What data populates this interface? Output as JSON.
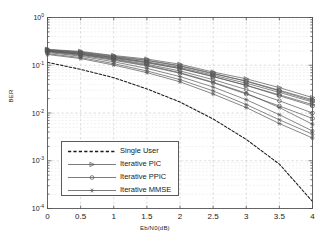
{
  "figure": {
    "background": "#ffffff",
    "axes_color": "#4d4d4d",
    "grid_color": "#c8c8c8",
    "curve_color": "#595959",
    "reference_color": "#1a1a1a"
  },
  "axis": {
    "xlabel": "Eb/N0(dB)",
    "ylabel": "BER",
    "xticks": [
      "0",
      "0.5",
      "1",
      "1.5",
      "2",
      "2.5",
      "3",
      "3.5",
      "4"
    ],
    "yticks": [
      "10",
      "10",
      "10",
      "10",
      "10"
    ],
    "yexps": [
      "0",
      "-1",
      "-2",
      "-3",
      "-4"
    ]
  },
  "legend": {
    "entries": [
      {
        "label": "Single User",
        "marker": "none",
        "style": "dashed"
      },
      {
        "label": "Iterative PIC",
        "marker": "triangle",
        "style": "solid"
      },
      {
        "label": "Iterative PPIC",
        "marker": "circle",
        "style": "solid"
      },
      {
        "label": "Iterative MMSE",
        "marker": "star",
        "style": "solid"
      }
    ]
  },
  "chart_data": {
    "type": "line",
    "title": "",
    "xlabel": "Eb/N0(dB)",
    "ylabel": "BER",
    "xlim": [
      0,
      4
    ],
    "ylim": [
      0.0001,
      1
    ],
    "yscale": "log",
    "grid": true,
    "legend_position": "lower-left-inside",
    "x": [
      0,
      0.5,
      1,
      1.5,
      2,
      2.5,
      3,
      3.5,
      4
    ],
    "series": [
      {
        "name": "Single User",
        "marker": "none",
        "style": "dashed",
        "values": [
          0.115,
          0.082,
          0.055,
          0.032,
          0.017,
          0.0075,
          0.0028,
          0.00085,
          0.00014
        ]
      },
      {
        "name": "Iterative PIC iter 1",
        "marker": "triangle",
        "style": "solid",
        "values": [
          0.215,
          0.195,
          0.16,
          0.135,
          0.105,
          0.072,
          0.052,
          0.034,
          0.021
        ]
      },
      {
        "name": "Iterative PIC iter 2",
        "marker": "triangle",
        "style": "solid",
        "values": [
          0.21,
          0.185,
          0.15,
          0.125,
          0.096,
          0.066,
          0.047,
          0.03,
          0.019
        ]
      },
      {
        "name": "Iterative PIC iter 3",
        "marker": "triangle",
        "style": "solid",
        "values": [
          0.205,
          0.178,
          0.145,
          0.118,
          0.09,
          0.062,
          0.042,
          0.027,
          0.017
        ]
      },
      {
        "name": "Iterative PIC iter 4",
        "marker": "triangle",
        "style": "solid",
        "values": [
          0.2,
          0.172,
          0.14,
          0.112,
          0.085,
          0.058,
          0.038,
          0.024,
          0.015
        ]
      },
      {
        "name": "Iterative PPIC iter 1",
        "marker": "circle",
        "style": "solid",
        "values": [
          0.212,
          0.19,
          0.155,
          0.128,
          0.098,
          0.068,
          0.046,
          0.029,
          0.018
        ]
      },
      {
        "name": "Iterative PPIC iter 2",
        "marker": "circle",
        "style": "solid",
        "values": [
          0.205,
          0.18,
          0.145,
          0.115,
          0.086,
          0.058,
          0.038,
          0.023,
          0.014
        ]
      },
      {
        "name": "Iterative PPIC iter 3",
        "marker": "circle",
        "style": "solid",
        "values": [
          0.198,
          0.17,
          0.135,
          0.105,
          0.076,
          0.05,
          0.031,
          0.018,
          0.01
        ]
      },
      {
        "name": "Iterative PPIC iter 4",
        "marker": "circle",
        "style": "solid",
        "values": [
          0.192,
          0.162,
          0.127,
          0.097,
          0.068,
          0.043,
          0.025,
          0.014,
          0.0077
        ]
      },
      {
        "name": "Iterative MMSE iter 1",
        "marker": "star",
        "style": "solid",
        "values": [
          0.196,
          0.168,
          0.132,
          0.1,
          0.07,
          0.044,
          0.026,
          0.013,
          0.0058
        ]
      },
      {
        "name": "Iterative MMSE iter 2",
        "marker": "star",
        "style": "solid",
        "values": [
          0.185,
          0.155,
          0.118,
          0.086,
          0.058,
          0.035,
          0.019,
          0.0092,
          0.0042
        ]
      },
      {
        "name": "Iterative MMSE iter 3",
        "marker": "star",
        "style": "solid",
        "values": [
          0.175,
          0.145,
          0.108,
          0.076,
          0.05,
          0.029,
          0.015,
          0.0072,
          0.0036
        ]
      },
      {
        "name": "Iterative MMSE iter 4",
        "marker": "star",
        "style": "solid",
        "values": [
          0.168,
          0.138,
          0.101,
          0.07,
          0.045,
          0.025,
          0.013,
          0.006,
          0.003
        ]
      }
    ]
  }
}
